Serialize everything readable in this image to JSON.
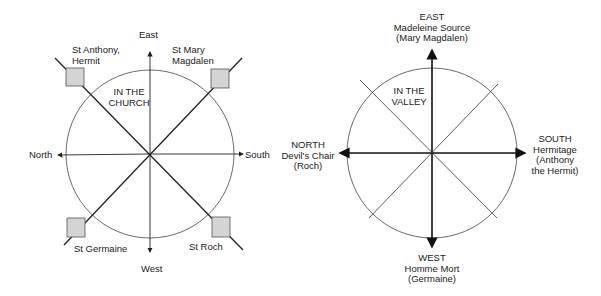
{
  "church": {
    "title": "IN THE CHURCH",
    "title_lines": [
      "IN THE",
      "CHURCH"
    ],
    "directions": {
      "east": "East",
      "west": "West",
      "north": "North",
      "south": "South"
    },
    "saints": {
      "top_left": [
        "St Anthony,",
        "Hermit"
      ],
      "top_right": [
        "St Mary",
        "Magdalen"
      ],
      "bottom_left": "St Germaine",
      "bottom_right": "St Roch"
    }
  },
  "valley": {
    "title_lines": [
      "IN THE",
      "VALLEY"
    ],
    "east": [
      "EAST",
      "Madeleine Source",
      "(Mary Magdalen)"
    ],
    "west": [
      "WEST",
      "Homme Mort",
      "(Germaine)"
    ],
    "north": [
      "NORTH",
      "Devil's Chair",
      "(Roch)"
    ],
    "south": [
      "SOUTH",
      "Hermitage",
      "(Anthony",
      "the Hermit)"
    ]
  },
  "colors": {
    "line": "#222222",
    "square_fill": "#d4d4d4"
  }
}
